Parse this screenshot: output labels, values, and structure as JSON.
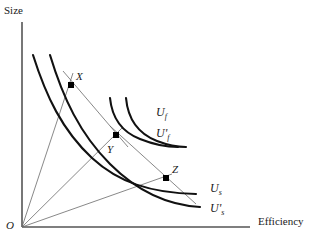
{
  "figure": {
    "type": "economics-indifference-curve-diagram",
    "axes": {
      "y_label": "Size",
      "x_label": "Efficiency",
      "origin_label": "O",
      "x_axis_from": [
        22,
        227
      ],
      "x_axis_to": [
        250,
        227
      ],
      "y_axis_from": [
        22,
        227
      ],
      "y_axis_to": [
        22,
        22
      ]
    },
    "colors": {
      "axis": "#555555",
      "curve": "#111111",
      "ray": "#6a6a6a",
      "point": "#000000",
      "text": "#1a1a1a",
      "background": "#ffffff"
    },
    "points": [
      {
        "id": "X",
        "label": "X",
        "x": 71,
        "y": 85,
        "label_x": 76,
        "label_y": 73
      },
      {
        "id": "Y",
        "label": "Y",
        "x": 116,
        "y": 135,
        "label_x": 108,
        "label_y": 145
      },
      {
        "id": "Z",
        "label": "Z",
        "x": 166,
        "y": 178,
        "label_x": 172,
        "label_y": 166
      }
    ],
    "curves": [
      {
        "id": "Us",
        "label_base": "U",
        "label_sub": "s",
        "label_prime": "",
        "label_x": 210,
        "label_y": 183,
        "class": "steep",
        "path": "M 33,55 C 46,96 62,130 92,158 C 118,182 150,193 196,194"
      },
      {
        "id": "Usprime",
        "label_base": "U",
        "label_sub": "s",
        "label_prime": "'",
        "label_x": 210,
        "label_y": 203,
        "class": "steep",
        "path": "M 50,55 C 63,98 80,134 110,164 C 136,190 166,205 200,207"
      },
      {
        "id": "Uf",
        "label_base": "U",
        "label_sub": "f",
        "label_prime": "",
        "label_x": 156,
        "label_y": 107,
        "class": "flat",
        "path": "M 110,98 C 112,118 122,132 140,139 C 155,145 167,147 178,147"
      },
      {
        "id": "Ufprime",
        "label_base": "U",
        "label_sub": "f",
        "label_prime": "'",
        "label_x": 156,
        "label_y": 128,
        "class": "flat",
        "path": "M 126,98 C 128,120 139,134 157,141 C 170,146 178,147 186,147"
      }
    ],
    "rays": [
      {
        "id": "ray-to-X",
        "from": [
          22,
          227
        ],
        "to": [
          73,
          73
        ]
      },
      {
        "id": "ray-to-Y",
        "from": [
          22,
          227
        ],
        "to": [
          122,
          128
        ]
      },
      {
        "id": "ray-to-Z",
        "from": [
          22,
          227
        ],
        "to": [
          172,
          174
        ]
      }
    ],
    "tangents": [
      {
        "id": "tangent-X-Y",
        "from": [
          63,
          71
        ],
        "to": [
          128,
          147
        ]
      },
      {
        "id": "tangent-Y-Z",
        "from": [
          110,
          126
        ],
        "to": [
          196,
          204
        ]
      }
    ],
    "labels": {
      "y_axis_pos": {
        "x": 4,
        "y": 6
      },
      "x_axis_pos": {
        "x": 258,
        "y": 216
      },
      "origin_pos": {
        "x": 6,
        "y": 222
      }
    }
  }
}
